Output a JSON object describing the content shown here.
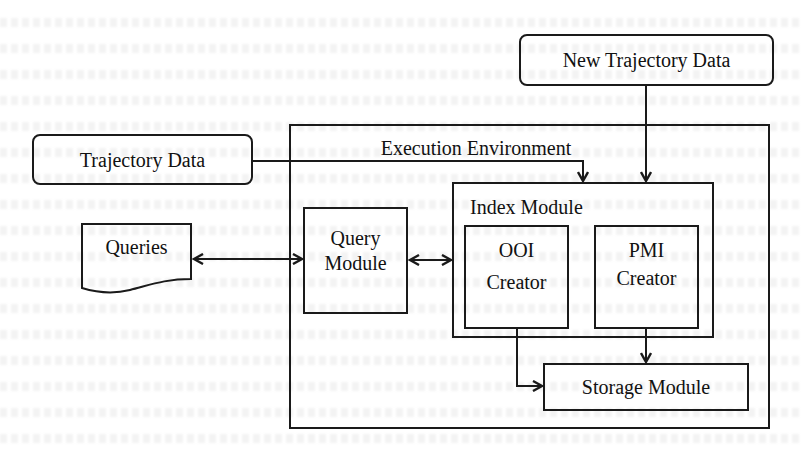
{
  "diagram": {
    "title": "",
    "nodes": [
      {
        "id": "new_trajectory_data",
        "label": "New Trajectory Data",
        "shape": "rounded-rect"
      },
      {
        "id": "trajectory_data",
        "label": "Trajectory Data",
        "shape": "rounded-rect"
      },
      {
        "id": "queries",
        "label": "Queries",
        "shape": "document"
      },
      {
        "id": "execution_environment",
        "label": "Execution Environment",
        "shape": "container"
      },
      {
        "id": "query_module",
        "label_line1": "Query",
        "label_line2": "Module",
        "shape": "rect"
      },
      {
        "id": "index_module",
        "label": "Index Module",
        "shape": "container"
      },
      {
        "id": "ooi_creator",
        "label_line1": "OOI",
        "label_line2": "Creator",
        "shape": "rect"
      },
      {
        "id": "pmi_creator",
        "label_line1": "PMI",
        "label_line2": "Creator",
        "shape": "rect"
      },
      {
        "id": "storage_module",
        "label": "Storage Module",
        "shape": "rect"
      }
    ],
    "edges": [
      {
        "from": "new_trajectory_data",
        "to": "index_module",
        "type": "arrow"
      },
      {
        "from": "trajectory_data",
        "to": "index_module",
        "type": "arrow"
      },
      {
        "from": "queries",
        "to": "query_module",
        "type": "bidirectional"
      },
      {
        "from": "query_module",
        "to": "index_module",
        "type": "bidirectional"
      },
      {
        "from": "ooi_creator",
        "to": "storage_module",
        "type": "arrow"
      },
      {
        "from": "pmi_creator",
        "to": "storage_module",
        "type": "arrow"
      }
    ]
  },
  "labels": {
    "new_trajectory_data": "New Trajectory Data",
    "trajectory_data": "Trajectory Data",
    "queries": "Queries",
    "execution_environment": "Execution Environment",
    "query_module_1": "Query",
    "query_module_2": "Module",
    "index_module": "Index Module",
    "ooi_1": "OOI",
    "ooi_2": "Creator",
    "pmi_1": "PMI",
    "pmi_2": "Creator",
    "storage_module": "Storage Module"
  },
  "colors": {
    "stroke": "#1a1a1a",
    "background": "#ffffff"
  }
}
